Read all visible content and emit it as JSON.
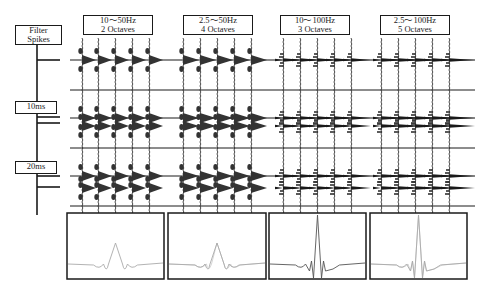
{
  "figure": {
    "left_axis": {
      "labels": [
        {
          "line1": "Filter",
          "line2": "Spikes"
        },
        {
          "line1": "10ms"
        },
        {
          "line1": "20ms"
        }
      ]
    },
    "panels": [
      {
        "freq": "10～50Hz",
        "octaves": "2 Octaves",
        "bandwidth_octaves": 2,
        "fmin_hz": 10,
        "fmax_hz": 50
      },
      {
        "freq": "2.5～50Hz",
        "octaves": "4 Octaves",
        "bandwidth_octaves": 4,
        "fmin_hz": 2.5,
        "fmax_hz": 50
      },
      {
        "freq": "10～100Hz",
        "octaves": "3 Octaves",
        "bandwidth_octaves": 3,
        "fmin_hz": 10,
        "fmax_hz": 100
      },
      {
        "freq": "2.5～100Hz",
        "octaves": "5 Octaves",
        "bandwidth_octaves": 5,
        "fmin_hz": 2.5,
        "fmax_hz": 100
      }
    ],
    "spike_rows": [
      {
        "label": "single spike",
        "spike_times_ms": [
          0
        ]
      },
      {
        "label": "10ms",
        "spike_times_ms": [
          0,
          10
        ]
      },
      {
        "label": "20ms",
        "spike_times_ms": [
          0,
          20
        ]
      }
    ],
    "traces_per_panel": 5,
    "colors": {
      "ink": "#1a1a1a",
      "fill": "#333333",
      "wavelet_light": "#aaaaaa",
      "wavelet_dark": "#555555"
    }
  }
}
